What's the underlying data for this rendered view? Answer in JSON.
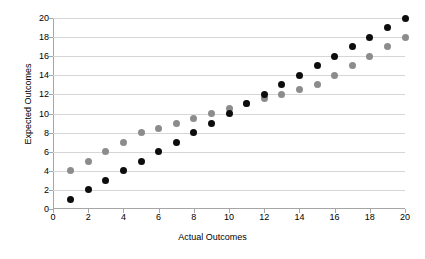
{
  "chart_data": {
    "type": "scatter",
    "title": "",
    "xlabel": "Actual Outcomes",
    "ylabel": "Expected Outcomes",
    "xlim": [
      0,
      20
    ],
    "ylim": [
      0,
      20
    ],
    "xticks": [
      0,
      2,
      4,
      6,
      8,
      10,
      12,
      14,
      16,
      18,
      20
    ],
    "yticks": [
      0,
      2,
      4,
      6,
      8,
      10,
      12,
      14,
      16,
      18,
      20
    ],
    "grid": "horizontal",
    "legend": "none",
    "series": [
      {
        "name": "black-series",
        "color": "#0d0d0d",
        "marker": "circle",
        "x": [
          1,
          2,
          3,
          4,
          5,
          6,
          7,
          8,
          9,
          10,
          11,
          12,
          13,
          14,
          15,
          16,
          17,
          18,
          19,
          20
        ],
        "y": [
          1,
          2,
          3,
          4,
          5,
          6,
          7,
          8,
          9,
          10,
          11,
          12,
          13,
          14,
          15,
          16,
          17,
          18,
          19,
          20
        ]
      },
      {
        "name": "gray-series",
        "color": "#8c8c8c",
        "marker": "circle",
        "x": [
          1,
          2,
          3,
          4,
          5,
          6,
          7,
          8,
          9,
          10,
          11,
          12,
          13,
          14,
          15,
          16,
          17,
          18,
          19,
          20
        ],
        "y": [
          4,
          5,
          6,
          7,
          8,
          8.4,
          9,
          9.5,
          10,
          10.5,
          11,
          11.6,
          12,
          12.5,
          13,
          14,
          15,
          16,
          17,
          18
        ]
      }
    ]
  },
  "axes": {
    "x_title": "Actual Outcomes",
    "y_title": "Expected Outcomes"
  },
  "tick_labels": {
    "y": [
      "20",
      "18",
      "16",
      "14",
      "12",
      "10",
      "8",
      "6",
      "4",
      "2",
      "0"
    ],
    "x": [
      "0",
      "2",
      "4",
      "6",
      "8",
      "10",
      "12",
      "14",
      "16",
      "18",
      "20"
    ]
  },
  "colors": {
    "series_black": "#0d0d0d",
    "series_gray": "#8c8c8c",
    "gridline": "#d6d6d6",
    "axis": "#a6a6a6",
    "background": "#ffffff"
  }
}
